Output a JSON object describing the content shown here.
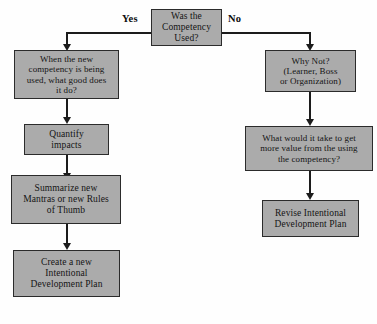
{
  "diagram": {
    "background_color": "#fefefe",
    "node_fill_color": "#ababab",
    "node_border_color": "#2b2b2b",
    "connector_color": "#1c1c1c"
  },
  "decision": {
    "text": "Was the\nCompetency\nUsed?",
    "yes_label": "Yes",
    "no_label": "No"
  },
  "yes_branch": {
    "step1": "When the new\ncompetency is being\nused, what good does\nit do?",
    "step2": "Quantify\nimpacts",
    "step3": "Summarize new\nMantras or new Rules\nof Thumb",
    "step4": "Create a new\nIntentional\nDevelopment Plan"
  },
  "no_branch": {
    "step1": "Why Not?\n(Learner, Boss\nor Organization)",
    "step2": "What would it take to get\nmore value from the using\nthe competency?",
    "step3": "Revise Intentional\nDevelopment Plan"
  }
}
